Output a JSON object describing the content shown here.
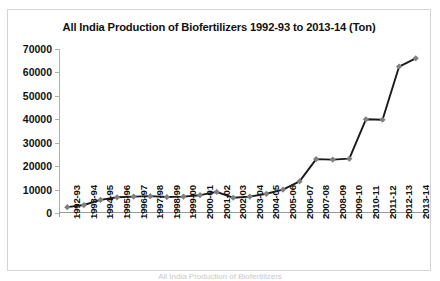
{
  "chart_data": {
    "type": "line",
    "title": "All India Production of Biofertilizers 1992-93 to 2013-14 (Ton)",
    "xlabel": "",
    "ylabel": "",
    "ylim": [
      0,
      70000
    ],
    "ytick_step": 10000,
    "yticks": [
      "70000",
      "60000",
      "50000",
      "40000",
      "30000",
      "20000",
      "10000",
      "0"
    ],
    "ytick_values": [
      70000,
      60000,
      50000,
      40000,
      30000,
      20000,
      10000,
      0
    ],
    "grid": false,
    "legend": "none",
    "marker": "diamond",
    "line_color": "#1a1a1a",
    "marker_color": "#808080",
    "categories": [
      "1992-93",
      "1993-94",
      "1994-95",
      "1995-96",
      "1996-97",
      "1997-98",
      "1998-99",
      "1999-00",
      "2000-01",
      "2001-02",
      "2002-03",
      "2003-04",
      "2004-05",
      "2005-06",
      "2006-07",
      "2007-08",
      "2008-09",
      "2009-10",
      "2010-11",
      "2011-12",
      "2012-13",
      "2013-14"
    ],
    "values": [
      2500,
      3400,
      5600,
      6700,
      7000,
      7200,
      6800,
      7000,
      7600,
      9000,
      6500,
      7000,
      8200,
      10000,
      13500,
      23000,
      22800,
      23200,
      40000,
      39800,
      62500,
      66000
    ],
    "series_name": "Biofertilizer Production (Ton)",
    "units": "Ton"
  },
  "footer": {
    "caption": "All India Production of Biofertilizers"
  }
}
